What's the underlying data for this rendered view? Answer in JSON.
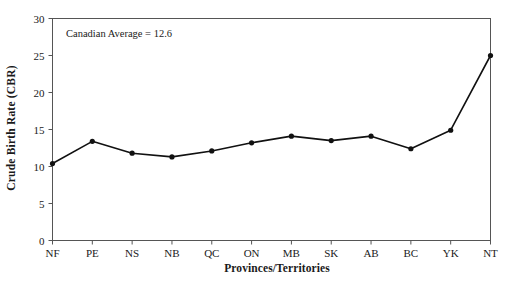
{
  "chart_data": {
    "type": "line",
    "title": "",
    "xlabel": "Provinces/Territories",
    "ylabel": "Crude Birth Rate (CBR)",
    "categories": [
      "NF",
      "PE",
      "NS",
      "NB",
      "QC",
      "ON",
      "MB",
      "SK",
      "AB",
      "BC",
      "YK",
      "NT"
    ],
    "values": [
      10.4,
      13.4,
      11.8,
      11.3,
      12.1,
      13.2,
      14.1,
      13.5,
      14.1,
      12.4,
      14.9,
      25.0
    ],
    "series": [
      {
        "name": "Crude Birth Rate (CBR)",
        "values": [
          10.4,
          13.4,
          11.8,
          11.3,
          12.1,
          13.2,
          14.1,
          13.5,
          14.1,
          12.4,
          14.9,
          25.0
        ]
      }
    ],
    "ylim": [
      0,
      30
    ],
    "yticks": [
      0,
      5,
      10,
      15,
      20,
      25,
      30
    ],
    "ytick_labels": [
      "0",
      "5",
      "10",
      "15",
      "20",
      "25",
      "30"
    ],
    "grid": false,
    "legend": false,
    "legend_position": "none",
    "marker": "filled-circle",
    "line_color": "#111111",
    "marker_color": "#111111",
    "axis_color": "#555555",
    "background_color": "#ffffff",
    "annotations": [
      {
        "text": "Canadian Average = 12.6",
        "x_value": "PE",
        "y_value": 27.2
      }
    ]
  },
  "annotation": {
    "canadian_average_label": "Canadian Average = 12.6"
  },
  "axes": {
    "y_title": "Crude Birth Rate (CBR)",
    "x_title": "Provinces/Territories"
  }
}
